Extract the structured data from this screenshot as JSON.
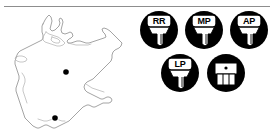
{
  "figure": {
    "divider": "horizontal-rule"
  },
  "map": {
    "name": "germany-outline-map",
    "description": "Outline map of Germany with two site markers",
    "markers": [
      {
        "name": "site-marker-north",
        "label": "",
        "x": 64,
        "y": 62
      },
      {
        "name": "site-marker-south",
        "label": "",
        "x": 53,
        "y": 108
      }
    ],
    "outline_color": "#9a9a9a",
    "marker_color": "#000000"
  },
  "icons": {
    "circle_color": "#000000",
    "tooth_color": "#ffffff",
    "plate_color": "#ffffff",
    "rows": [
      {
        "name": "icon-row-top",
        "items": [
          {
            "name": "tooth-icon-rr",
            "label": "RR",
            "type": "single-root-tooth"
          },
          {
            "name": "tooth-icon-mp",
            "label": "MP",
            "type": "single-root-tooth"
          },
          {
            "name": "tooth-icon-ap",
            "label": "AP",
            "type": "single-root-tooth"
          }
        ]
      },
      {
        "name": "icon-row-bottom",
        "items": [
          {
            "name": "tooth-icon-lp",
            "label": "LP",
            "type": "single-root-tooth"
          },
          {
            "name": "tooth-icon-molar",
            "label": "",
            "type": "multi-root-molar"
          }
        ]
      }
    ]
  }
}
